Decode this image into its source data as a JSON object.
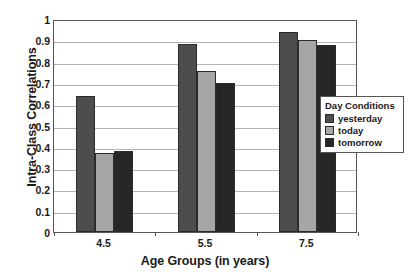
{
  "chart_data": {
    "type": "bar",
    "title": "",
    "xlabel": "Age Groups (in years)",
    "ylabel": "Intra-Class Correlations",
    "categories": [
      "4.5",
      "5.5",
      "7.5"
    ],
    "ylim": [
      0,
      1
    ],
    "yticks": [
      "0",
      "0.1",
      "0.2",
      "0.3",
      "0.4",
      "0.5",
      "0.6",
      "0.7",
      "0.8",
      "0.9",
      "1"
    ],
    "grid": true,
    "legend_position": "right",
    "legend_title": "Day Conditions",
    "series": [
      {
        "name": "yesterday",
        "color": "#4d4d4d",
        "values": [
          0.64,
          0.885,
          0.94
        ]
      },
      {
        "name": "today",
        "color": "#a6a6a6",
        "values": [
          0.37,
          0.755,
          0.9
        ]
      },
      {
        "name": "tomorrow",
        "color": "#262626",
        "values": [
          0.38,
          0.7,
          0.88
        ]
      }
    ]
  }
}
